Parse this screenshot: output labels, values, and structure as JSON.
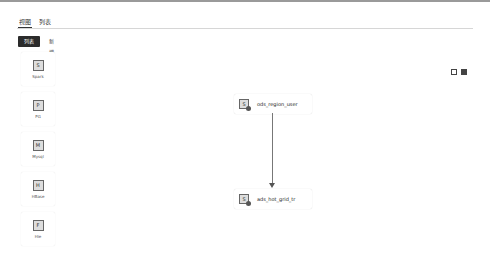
{
  "tabs": [
    {
      "label": "视图",
      "active": true
    },
    {
      "label": "列表",
      "active": false
    }
  ],
  "toggle": {
    "primary_label": "列表",
    "secondary_label": "新增"
  },
  "palette": [
    {
      "icon": "spark-icon",
      "glyph": "S",
      "label": "Spark"
    },
    {
      "icon": "pg-icon",
      "glyph": "P",
      "label": "PG"
    },
    {
      "icon": "mysql-icon",
      "glyph": "M",
      "label": "Mysql"
    },
    {
      "icon": "hbase-icon",
      "glyph": "H",
      "label": "HBase"
    },
    {
      "icon": "hive-icon",
      "glyph": "F",
      "label": "Hie"
    }
  ],
  "tools": [
    {
      "icon": "fit-view-icon"
    },
    {
      "icon": "fullscreen-icon"
    }
  ],
  "nodes": [
    {
      "id": "n1",
      "glyph": "S",
      "label": "ods_region_user"
    },
    {
      "id": "n2",
      "glyph": "S",
      "label": "ads_hot_grid_tr"
    }
  ],
  "edges": [
    {
      "from": "ods_region_user",
      "to": "ads_hot_grid_tr"
    }
  ]
}
